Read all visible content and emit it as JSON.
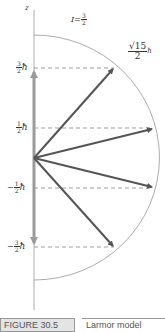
{
  "diagram": {
    "axis_label": "z",
    "spin_label": {
      "symbol": "I",
      "equals": "=",
      "num": "3",
      "den": "2"
    },
    "magnitude_label": {
      "sqrt": "√15",
      "den": "2",
      "unit": "ħ"
    },
    "levels": [
      {
        "sign": "",
        "num": "3",
        "den": "2",
        "unit": "ħ"
      },
      {
        "sign": "",
        "num": "1",
        "den": "2",
        "unit": "ħ"
      },
      {
        "sign": "−",
        "num": "1",
        "den": "2",
        "unit": "ħ"
      },
      {
        "sign": "−",
        "num": "3",
        "den": "2",
        "unit": "ħ"
      }
    ],
    "colors": {
      "vector": "#555555",
      "axis_arrow": "#9a9a9a",
      "arc": "#888888",
      "dash": "#777777"
    }
  },
  "caption": {
    "figure_label": "FIGURE 30.5",
    "text": "Larmor model"
  }
}
